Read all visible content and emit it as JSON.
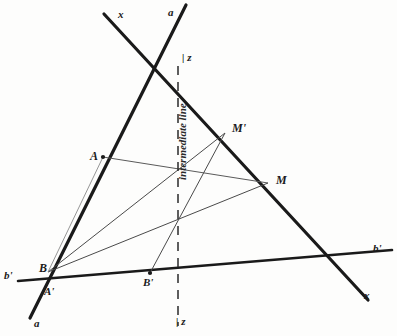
{
  "figure": {
    "kind": "geometric-construction-diagram",
    "background_color": "#fdfdfc",
    "ink_color": "#1a1a1a",
    "thin_ink_color": "#4a4a4a",
    "width": 397,
    "height": 336
  },
  "annotation": {
    "intermediate_line_label": "intermediate line",
    "z_top_label": "z",
    "z_bottom_label": "z",
    "z_tick_glyph": "|"
  },
  "line_labels": {
    "x_top": "x",
    "a_top": "a",
    "a_bottom": "a",
    "x_bottom": "x",
    "b_prime_left": "b'",
    "b_prime_right": "b'"
  },
  "points": [
    {
      "name": "A",
      "label": "A",
      "x": 103,
      "y": 157,
      "marker": true
    },
    {
      "name": "B",
      "label": "B",
      "x": 48,
      "y": 272,
      "marker": false
    },
    {
      "name": "A'",
      "label": "A'",
      "x": 52,
      "y": 283,
      "marker": false
    },
    {
      "name": "B'",
      "label": "B'",
      "x": 150,
      "y": 273,
      "marker": true
    },
    {
      "name": "M",
      "label": "M",
      "x": 268,
      "y": 183,
      "marker": false
    },
    {
      "name": "M'",
      "label": "M'",
      "x": 225,
      "y": 133,
      "marker": false
    }
  ],
  "thick_lines": [
    {
      "name": "line-x",
      "x1": 104,
      "y1": 14,
      "x2": 368,
      "y2": 300
    },
    {
      "name": "line-a",
      "x1": 186,
      "y1": 5,
      "x2": 30,
      "y2": 318
    },
    {
      "name": "line-b-prime",
      "x1": 18,
      "y1": 281,
      "x2": 392,
      "y2": 250
    }
  ],
  "dashed_line": {
    "name": "line-z",
    "x": 178,
    "y1": 66,
    "y2": 326
  },
  "thin_lines": [
    {
      "name": "segment-A-M",
      "x1": 103,
      "y1": 157,
      "x2": 268,
      "y2": 183
    },
    {
      "name": "segment-B-M",
      "x1": 48,
      "y1": 272,
      "x2": 268,
      "y2": 183
    },
    {
      "name": "segment-B-M-prime",
      "x1": 48,
      "y1": 272,
      "x2": 225,
      "y2": 133
    },
    {
      "name": "segment-B-prime-M-prime",
      "x1": 150,
      "y1": 273,
      "x2": 225,
      "y2": 133
    },
    {
      "name": "segment-B-A",
      "x1": 48,
      "y1": 272,
      "x2": 103,
      "y2": 157
    }
  ],
  "label_positions": {
    "x_top": {
      "x": 118,
      "y": 9
    },
    "a_top": {
      "x": 168,
      "y": 7
    },
    "z_top": {
      "x": 182,
      "y": 52
    },
    "intermediate": {
      "x": 176,
      "y": 180
    },
    "M_prime": {
      "x": 232,
      "y": 122
    },
    "M": {
      "x": 276,
      "y": 174
    },
    "A": {
      "x": 90,
      "y": 150
    },
    "b_prime_left": {
      "x": 4,
      "y": 270
    },
    "b_prime_right": {
      "x": 373,
      "y": 243
    },
    "B": {
      "x": 39,
      "y": 262
    },
    "A_prime": {
      "x": 44,
      "y": 286
    },
    "B_prime": {
      "x": 143,
      "y": 277
    },
    "a_bottom": {
      "x": 34,
      "y": 318
    },
    "x_bottom": {
      "x": 364,
      "y": 290
    },
    "z_bottom": {
      "x": 176,
      "y": 316
    }
  }
}
